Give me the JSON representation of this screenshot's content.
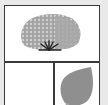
{
  "grid": {
    "cells": [
      {
        "position": "top",
        "icon": "shrub-icon"
      },
      {
        "position": "bottom-left",
        "icon": null
      },
      {
        "position": "bottom-right",
        "icon": "leaf-icon"
      }
    ]
  },
  "colors": {
    "background": "#e9e9e9",
    "border": "#3a3a3a",
    "cell": "#ffffff",
    "foliage": "#a0a0a0",
    "foliage_light": "#c4c4c4",
    "stem": "#222222",
    "leaf": "#8f8f8f"
  }
}
